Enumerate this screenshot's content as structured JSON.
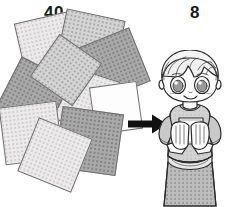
{
  "scene": {
    "description": "Illustration: a scattered pile of square origami papers on the left, a black right-pointing arrow, and a smiling manga-style child holding papers on the right",
    "background_color": "#ffffff",
    "left_label": "40",
    "right_label": "8",
    "arrow": {
      "icon": "right-arrow-icon",
      "direction": "right",
      "color": "#111111"
    }
  },
  "papers": {
    "left_pile_count": "40",
    "held_count": "8",
    "tones": [
      "#eceaea",
      "#d4d4d4",
      "#a9a9a9",
      "#fdfdfd"
    ],
    "outline_color": "#6d6d6d",
    "sheets": [
      {
        "name": "sheet-1",
        "tone": "p-light",
        "left": 20,
        "top": 2,
        "size": 62,
        "rotate": -13
      },
      {
        "name": "sheet-2",
        "tone": "p-mid",
        "left": 60,
        "top": 0,
        "size": 60,
        "rotate": 12
      },
      {
        "name": "sheet-3",
        "tone": "p-dark",
        "left": 84,
        "top": 22,
        "size": 58,
        "rotate": -22
      },
      {
        "name": "sheet-4",
        "tone": "p-light",
        "left": 57,
        "top": 58,
        "size": 56,
        "rotate": 18
      },
      {
        "name": "sheet-5",
        "tone": "p-dark",
        "left": 6,
        "top": 52,
        "size": 56,
        "rotate": 27
      },
      {
        "name": "sheet-6",
        "tone": "p-white",
        "left": 92,
        "top": 70,
        "size": 48,
        "rotate": -8
      },
      {
        "name": "sheet-7",
        "tone": "p-light",
        "left": 2,
        "top": 90,
        "size": 58,
        "rotate": -7
      },
      {
        "name": "sheet-8",
        "tone": "p-dark",
        "left": 58,
        "top": 96,
        "size": 62,
        "rotate": 8
      },
      {
        "name": "sheet-9",
        "tone": "p-light",
        "left": 26,
        "top": 112,
        "size": 58,
        "rotate": 22
      },
      {
        "name": "sheet-10",
        "tone": "p-mid",
        "left": 40,
        "top": 30,
        "size": 52,
        "rotate": 35
      }
    ]
  },
  "character": {
    "name": "child-figure",
    "expression": "smiling",
    "hair_color": "#f2f2f2",
    "skin_color": "#fbfbfb",
    "shirt_color": "#cfcfcf",
    "skirt_color": "#b2b2b2",
    "line_color": "#2b2b2b",
    "holding": "stack of square papers",
    "pose": "both hands raised in front of chest holding papers"
  }
}
